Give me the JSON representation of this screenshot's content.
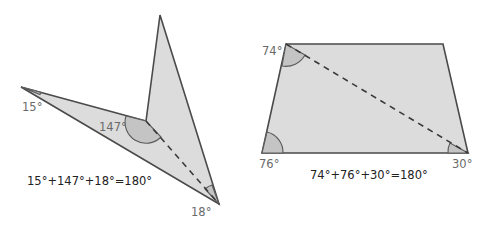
{
  "figures": [
    {
      "name": "concave-quadrilateral",
      "vertices": {
        "left": [
          21,
          87
        ],
        "top": [
          160,
          15
        ],
        "reflex": [
          146,
          121
        ],
        "bottom": [
          219,
          204
        ]
      },
      "angle_labels": [
        "15°",
        "147°",
        "18°"
      ],
      "equation": "15°+147°+18°=180°"
    },
    {
      "name": "trapezoid",
      "vertices": {
        "top_left": [
          286,
          44
        ],
        "top_right": [
          443,
          44
        ],
        "bottom_left": [
          262,
          153
        ],
        "bottom_right": [
          468,
          153
        ]
      },
      "angle_labels": [
        "74°",
        "76°",
        "30°"
      ],
      "equation": "74°+76°+30°=180°"
    }
  ],
  "colors": {
    "fill": "#dcdcdc",
    "angle_fill": "#c4c4c4",
    "stroke": "#4a4a4a",
    "label": "#6a6a6a",
    "equation": "#222222"
  }
}
